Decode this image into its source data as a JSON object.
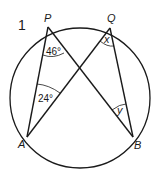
{
  "question_number": "1",
  "points": {
    "P": {
      "label": "P",
      "x": 48,
      "y": 27
    },
    "Q": {
      "label": "Q",
      "x": 110,
      "y": 28
    },
    "A": {
      "label": "A",
      "x": 27,
      "y": 137
    },
    "B": {
      "label": "B",
      "x": 133,
      "y": 137
    }
  },
  "circle": {
    "cx": 80,
    "cy": 98,
    "r": 70
  },
  "chords": [
    "PA",
    "PB",
    "QA",
    "QB"
  ],
  "angles": {
    "APB": {
      "label": "46°",
      "vertex": "P"
    },
    "PAQ": {
      "label": "24°",
      "vertex": "A"
    },
    "AQB": {
      "label": "x",
      "vertex": "Q"
    },
    "PBQ": {
      "label": "y",
      "vertex": "B"
    }
  },
  "colors": {
    "stroke": "#1a1a1a",
    "background": "#ffffff"
  }
}
